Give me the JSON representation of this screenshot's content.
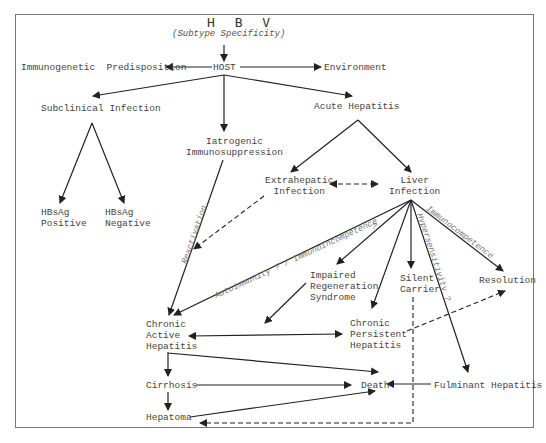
{
  "diagram": {
    "title": "H B V",
    "subtitle": "(Subtype Specificity)",
    "nodes": {
      "host": "HOST",
      "immunogenetic": "Immunogenetic  Predisposition",
      "environment": "Environment",
      "subclinical": "Subclinical Infection",
      "acute": "Acute Hepatitis",
      "iatrogenic": "Iatrogenic\nImmunosuppression",
      "hbsag_pos": "HBsAg\nPositive",
      "hbsag_neg": "HBsAg\nNegative",
      "extrahepatic": "Extrahepatic\nInfection",
      "liver": "Liver\nInfection",
      "impaired": "Impaired\nRegeneration\nSyndrome",
      "silent": "Silent\nCarrier",
      "resolution": "Resolution",
      "cah": "Chronic\nActive\nHepatitis",
      "cph": "Chronic\nPersistent\nHepatitis",
      "cirrhosis": "Cirrhosis",
      "death": "Death",
      "fulminant": "Fulminant Hepatitis",
      "hepatoma": "Hepatoma"
    },
    "edge_labels": {
      "reactivation": "Reactivation",
      "autoimmunity": "Autoimmunity ? / Immunoincompetence",
      "question": "?",
      "hyper": "Hypersensitivity ?",
      "immunocompetence": "Immunocompetence"
    },
    "colors": {
      "line": "#222222",
      "text": "#444444",
      "label": "#777777",
      "frame": "#777777"
    }
  }
}
